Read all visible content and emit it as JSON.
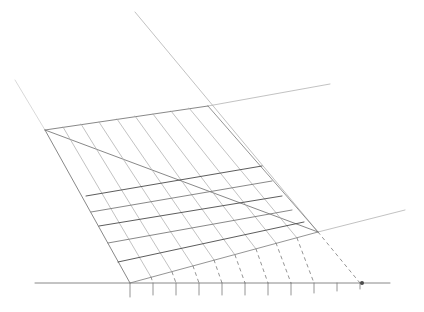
{
  "title": "Pencil sketch of a perspective grid",
  "canvas": {
    "width": 424,
    "height": 312,
    "background": "#ffffff"
  },
  "colors": {
    "faint": "#c9c9c9",
    "light": "#a8a8a8",
    "medium": "#7a7a7a",
    "dark": "#4a4a4a"
  },
  "sketch": {
    "construction_lines": [
      {
        "name": "left-upper-guide",
        "x1": 15,
        "y1": 80,
        "x2": 45,
        "y2": 130,
        "tone": "faint"
      },
      {
        "name": "top-long-guide",
        "x1": 135,
        "y1": 12,
        "x2": 318,
        "y2": 232,
        "tone": "light"
      },
      {
        "name": "top-edge-extension",
        "x1": 208,
        "y1": 106,
        "x2": 330,
        "y2": 84,
        "tone": "light"
      },
      {
        "name": "right-lower-guide",
        "x1": 318,
        "y1": 232,
        "x2": 405,
        "y2": 210,
        "tone": "light"
      },
      {
        "name": "diagonal",
        "x1": 45,
        "y1": 130,
        "x2": 318,
        "y2": 232,
        "tone": "medium"
      }
    ],
    "grid": {
      "top_edge": {
        "x1": 45,
        "y1": 130,
        "x2": 208,
        "y2": 106
      },
      "left_edge": {
        "x1": 45,
        "y1": 130,
        "x2": 130,
        "y2": 283
      },
      "right_edge": {
        "x1": 208,
        "y1": 106,
        "x2": 318,
        "y2": 232
      },
      "bottom_edge": {
        "x1": 130,
        "y1": 283,
        "x2": 318,
        "y2": 232
      },
      "slanted_lines": [
        {
          "x1": 63,
          "y1": 127,
          "x2": 151,
          "y2": 277
        },
        {
          "x1": 81,
          "y1": 124,
          "x2": 172,
          "y2": 272
        },
        {
          "x1": 99,
          "y1": 122,
          "x2": 193,
          "y2": 266
        },
        {
          "x1": 117,
          "y1": 119,
          "x2": 214,
          "y2": 260
        },
        {
          "x1": 135,
          "y1": 116,
          "x2": 235,
          "y2": 255
        },
        {
          "x1": 153,
          "y1": 114,
          "x2": 256,
          "y2": 249
        },
        {
          "x1": 171,
          "y1": 111,
          "x2": 276,
          "y2": 243
        },
        {
          "x1": 189,
          "y1": 108,
          "x2": 297,
          "y2": 238
        }
      ],
      "rungs": [
        {
          "x1": 86,
          "y1": 196,
          "x2": 262,
          "y2": 166
        },
        {
          "x1": 91,
          "y1": 212,
          "x2": 272,
          "y2": 181
        },
        {
          "x1": 99,
          "y1": 226,
          "x2": 282,
          "y2": 196
        },
        {
          "x1": 108,
          "y1": 243,
          "x2": 292,
          "y2": 210
        },
        {
          "x1": 118,
          "y1": 262,
          "x2": 304,
          "y2": 222
        }
      ]
    },
    "baseline": {
      "x1": 35,
      "y1": 283,
      "x2": 390,
      "y2": 283
    },
    "ticks": [
      {
        "x": 130,
        "len": 14
      },
      {
        "x": 153,
        "len": 12
      },
      {
        "x": 176,
        "len": 12
      },
      {
        "x": 199,
        "len": 12
      },
      {
        "x": 222,
        "len": 12
      },
      {
        "x": 245,
        "len": 12
      },
      {
        "x": 268,
        "len": 12
      },
      {
        "x": 291,
        "len": 12
      },
      {
        "x": 314,
        "len": 10
      },
      {
        "x": 337,
        "len": 8
      },
      {
        "x": 360,
        "len": 6
      }
    ],
    "dashed_projections": [
      {
        "x1": 151,
        "y1": 277,
        "x2": 153,
        "y2": 283
      },
      {
        "x1": 172,
        "y1": 272,
        "x2": 176,
        "y2": 283
      },
      {
        "x1": 193,
        "y1": 266,
        "x2": 199,
        "y2": 283
      },
      {
        "x1": 214,
        "y1": 260,
        "x2": 222,
        "y2": 283
      },
      {
        "x1": 235,
        "y1": 255,
        "x2": 245,
        "y2": 283
      },
      {
        "x1": 256,
        "y1": 249,
        "x2": 268,
        "y2": 283
      },
      {
        "x1": 276,
        "y1": 243,
        "x2": 291,
        "y2": 283
      },
      {
        "x1": 297,
        "y1": 238,
        "x2": 314,
        "y2": 283
      },
      {
        "x1": 318,
        "y1": 232,
        "x2": 360,
        "y2": 283
      }
    ],
    "vanishing_mark": {
      "x": 362,
      "y": 283,
      "r": 2
    }
  }
}
